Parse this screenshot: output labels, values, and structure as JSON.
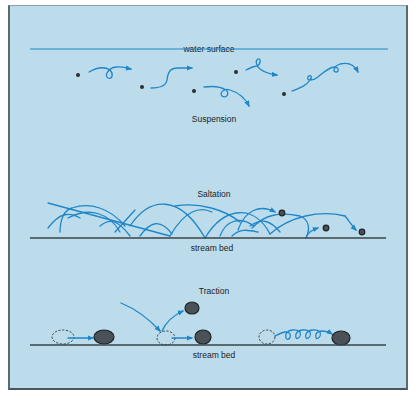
{
  "diagram": {
    "colors": {
      "background": "#bcdceb",
      "flow_lines": "#1f86c8",
      "stream_bed": "#3a4448",
      "particles": "#2a2f33"
    },
    "suspension": {
      "surface_label": "water surface",
      "label": "Suspension",
      "particle_count": 6
    },
    "saltation": {
      "label": "Saltation",
      "bed_label": "stream bed",
      "particle_count": 3
    },
    "traction": {
      "label": "Traction",
      "bed_label": "stream bed",
      "examples": [
        "sliding",
        "impact-launched",
        "rolling"
      ]
    }
  }
}
